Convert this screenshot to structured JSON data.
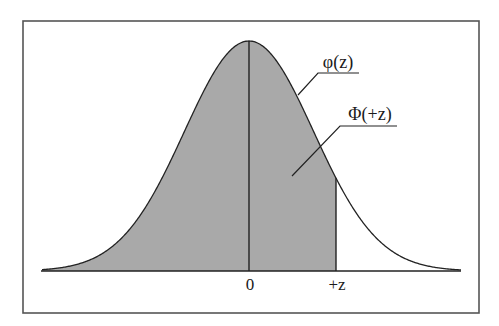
{
  "figure": {
    "type": "normal-distribution-diagram",
    "frame": {
      "x": 23,
      "y": 21,
      "width": 456,
      "height": 292
    },
    "colors": {
      "background": "#ffffff",
      "frame": "#555555",
      "curve": "#222222",
      "fill": "#a9a9a9",
      "axis": "#222222",
      "text": "#1a1a1a"
    }
  },
  "curve": {
    "label": "φ(z)",
    "description": "standard normal probability density",
    "mean_px": 249,
    "sigma_px": 64.6,
    "peak_y_px": 41,
    "baseline_y_px": 271,
    "x_start_px": 42,
    "x_end_px": 461
  },
  "shaded_area": {
    "label": "Φ(+z)",
    "description": "cumulative area from -∞ to +z",
    "from": "-∞",
    "to": "+z",
    "to_px": 336
  },
  "axis": {
    "ticks": [
      {
        "label": "0",
        "x_px": 249
      },
      {
        "label": "+z",
        "x_px": 336
      }
    ]
  },
  "annotations": [
    {
      "id": "pdf-label",
      "text": "φ(z)",
      "text_x": 338,
      "text_y": 68,
      "underline": [
        318,
        73,
        359,
        73
      ],
      "leader_to": [
        298,
        95
      ]
    },
    {
      "id": "cdf-label",
      "text": "Φ(+z)",
      "text_x": 370,
      "text_y": 120,
      "underline": [
        340,
        126,
        397,
        126
      ],
      "leader_to": [
        292,
        176
      ]
    }
  ]
}
